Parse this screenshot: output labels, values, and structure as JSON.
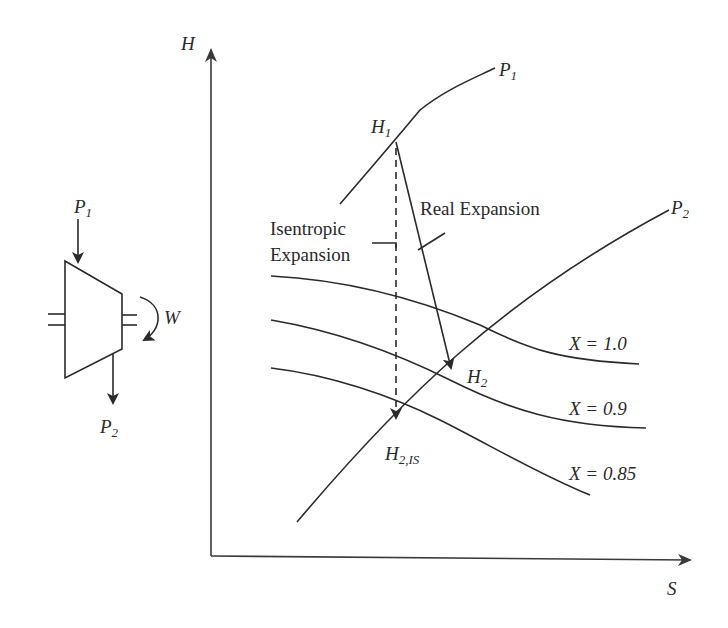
{
  "diagram": {
    "axes": {
      "y_label": "H",
      "x_label": "S"
    },
    "turbine": {
      "inlet_label": "P",
      "inlet_sub": "1",
      "outlet_label": "P",
      "outlet_sub": "2",
      "work_label": "W"
    },
    "isobars": [
      {
        "label": "P",
        "sub": "1"
      },
      {
        "label": "P",
        "sub": "2"
      }
    ],
    "quality_lines": [
      {
        "label": "X = 1.0"
      },
      {
        "label": "X = 0.9"
      },
      {
        "label": "X = 0.85"
      }
    ],
    "points": {
      "h1": {
        "label": "H",
        "sub": "1"
      },
      "h2": {
        "label": "H",
        "sub": "2"
      },
      "h2is": {
        "label": "H",
        "sub": "2,IS"
      }
    },
    "annotations": {
      "real_expansion": "Real Expansion",
      "isentropic_line1": "Isentropic",
      "isentropic_line2": "Expansion"
    },
    "colors": {
      "ink": "#2a2a2a",
      "background": "#ffffff"
    }
  }
}
